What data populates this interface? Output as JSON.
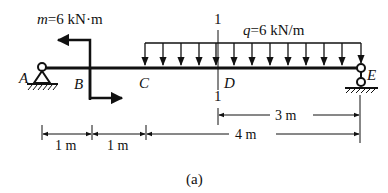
{
  "diagram": {
    "type": "beam-loading",
    "caption": "(a)",
    "points": [
      {
        "id": "A",
        "label": "A",
        "support": "pin"
      },
      {
        "id": "B",
        "label": "B"
      },
      {
        "id": "C",
        "label": "C"
      },
      {
        "id": "D",
        "label": "D"
      },
      {
        "id": "E",
        "label": "E",
        "support": "roller"
      }
    ],
    "section": {
      "label_top": "1",
      "label_bottom": "1",
      "at": "D"
    },
    "moment": {
      "label_var": "m",
      "label_rest": "=6 kN·m",
      "at": "B"
    },
    "distributed_load": {
      "label_var": "q",
      "label_rest": "=6 kN/m",
      "from": "C",
      "to": "E"
    },
    "dimensions": {
      "ab": "1 m",
      "bc": "1 m",
      "ce": "4 m",
      "de": "3 m"
    }
  }
}
